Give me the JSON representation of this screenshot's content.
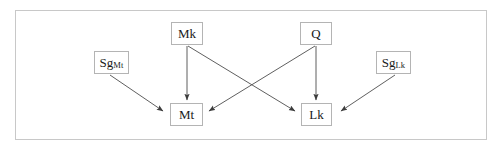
{
  "figure": {
    "title": "",
    "width": 504,
    "height": 151,
    "background_color": "#ffffff",
    "frame": {
      "name": "outer-frame",
      "x": 15,
      "y": 10,
      "width": 472,
      "height": 130,
      "border_color": "#c8c8c8"
    }
  },
  "diagram": {
    "type": "directed-graph",
    "node_border_color": "#b4b4b4",
    "node_fill_color": "#ffffff",
    "edge_color": "#4d4d4d",
    "text_color": "#1a1a1a",
    "nodes": [
      {
        "id": "Mk",
        "label": "Mk",
        "subscript": "",
        "x": 171,
        "y": 22,
        "width": 32,
        "height": 23
      },
      {
        "id": "Q",
        "label": "Q",
        "subscript": "",
        "x": 300,
        "y": 22,
        "width": 32,
        "height": 23
      },
      {
        "id": "SgMt",
        "label": "Sg",
        "subscript": "Mt",
        "x": 94,
        "y": 51,
        "width": 35,
        "height": 23
      },
      {
        "id": "SgLk",
        "label": "Sg",
        "subscript": "Lk",
        "x": 376,
        "y": 51,
        "width": 35,
        "height": 23
      },
      {
        "id": "Mt",
        "label": "Mt",
        "subscript": "",
        "x": 170,
        "y": 103,
        "width": 33,
        "height": 23
      },
      {
        "id": "Lk",
        "label": "Lk",
        "subscript": "",
        "x": 301,
        "y": 103,
        "width": 31,
        "height": 23
      }
    ],
    "edges": [
      {
        "id": "mk-mt",
        "from": "Mk",
        "to": "Mt",
        "x1": 187,
        "y1": 46,
        "x2": 187,
        "y2": 101
      },
      {
        "id": "q-lk",
        "from": "Q",
        "to": "Lk",
        "x1": 316,
        "y1": 46,
        "x2": 316,
        "y2": 101
      },
      {
        "id": "mk-lk",
        "from": "Mk",
        "to": "Lk",
        "x1": 188,
        "y1": 46,
        "x2": 296,
        "y2": 112
      },
      {
        "id": "q-mt",
        "from": "Q",
        "to": "Mt",
        "x1": 315,
        "y1": 46,
        "x2": 208,
        "y2": 112
      },
      {
        "id": "sgmt-mt",
        "from": "SgMt",
        "to": "Mt",
        "x1": 110,
        "y1": 75,
        "x2": 164,
        "y2": 112
      },
      {
        "id": "sglk-lk",
        "from": "SgLk",
        "to": "Lk",
        "x1": 395,
        "y1": 75,
        "x2": 340,
        "y2": 112
      }
    ]
  }
}
